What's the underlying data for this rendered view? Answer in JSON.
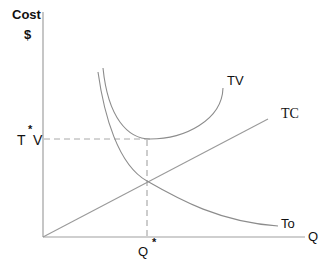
{
  "diagram": {
    "type": "economics-cost-curve",
    "axes": {
      "y_label_line1": "Cost",
      "y_label_line2": "$",
      "x_label": "Q"
    },
    "curves": [
      {
        "id": "TV",
        "label": "TV",
        "shape": "U-shaped"
      },
      {
        "id": "TC",
        "label": "TC",
        "shape": "linear increasing from origin"
      },
      {
        "id": "To",
        "label": "To",
        "shape": "decreasing convex"
      }
    ],
    "markers": {
      "y_marker_left": "T",
      "y_marker_star": "*",
      "y_marker_right": "V",
      "x_marker": "Q",
      "x_marker_star": "*"
    },
    "guides": {
      "horizontal_dashed": "from T*V to minimum of TV",
      "vertical_dashed": "from minimum of TV down to Q* (intersection of TC and To)"
    },
    "colors": {
      "axis": "#9a9a9a",
      "curve": "#8c8c8c",
      "dashed": "#9a9a9a",
      "text": "#111111"
    }
  }
}
